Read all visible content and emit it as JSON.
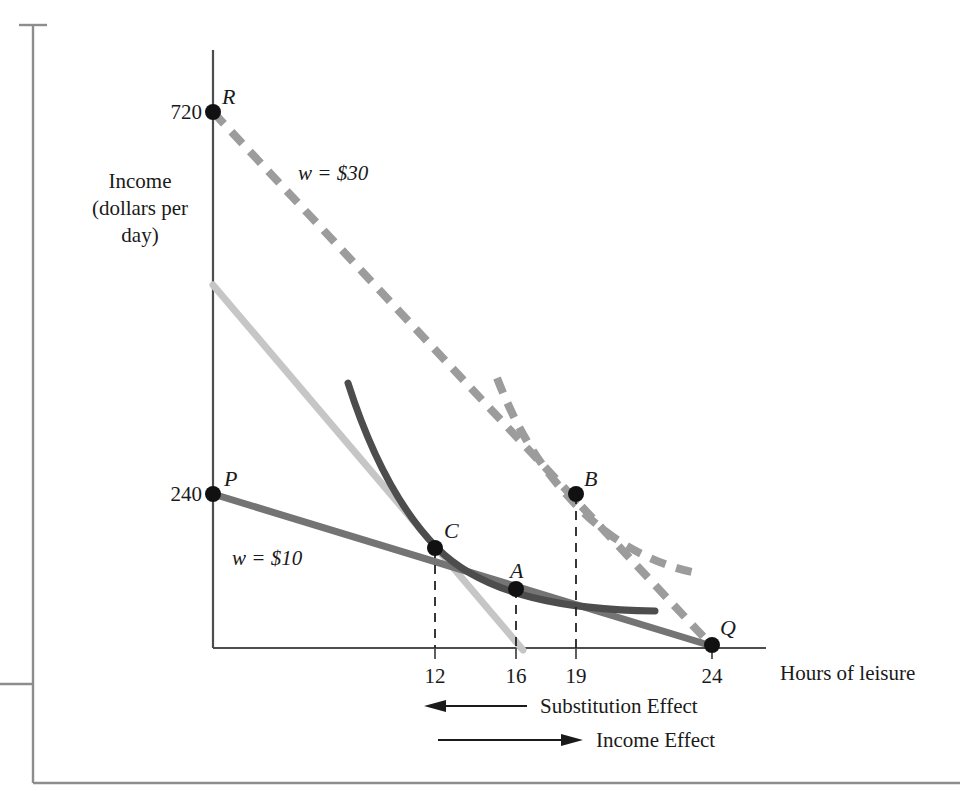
{
  "figure": {
    "axes": {
      "y_title_lines": [
        "Income",
        "(dollars per",
        "day)"
      ],
      "x_title": "Hours of leisure",
      "y_ticks": [
        {
          "value": 720,
          "label": "720"
        },
        {
          "value": 240,
          "label": "240"
        }
      ],
      "x_ticks": [
        {
          "value": 12,
          "label": "12"
        },
        {
          "value": 16,
          "label": "16"
        },
        {
          "value": 19,
          "label": "19"
        },
        {
          "value": 24,
          "label": "24"
        }
      ],
      "xlim": [
        0,
        26
      ],
      "ylim": [
        0,
        900
      ]
    },
    "points": [
      {
        "name": "R",
        "label": "R",
        "x": 0,
        "y": 720
      },
      {
        "name": "P",
        "label": "P",
        "x": 0,
        "y": 240
      },
      {
        "name": "C",
        "label": "C",
        "x": 12,
        "y": 170
      },
      {
        "name": "A",
        "label": "A",
        "x": 16,
        "y": 108
      },
      {
        "name": "B",
        "label": "B",
        "x": 19,
        "y": 250
      },
      {
        "name": "Q",
        "label": "Q",
        "x": 24,
        "y": 0
      }
    ],
    "budget_lines": [
      {
        "name": "high-wage-budget-line",
        "label": "w = $30",
        "style": "dashed",
        "color": "#9a9a9a",
        "from": {
          "x": 0,
          "y": 720
        },
        "to": {
          "x": 24,
          "y": 0
        }
      },
      {
        "name": "low-wage-budget-line",
        "label": "w = $10",
        "style": "solid",
        "color": "#6e6e6e",
        "from": {
          "x": 0,
          "y": 240
        },
        "to": {
          "x": 24,
          "y": 0
        }
      },
      {
        "name": "compensated-budget-line",
        "label": "",
        "style": "solid",
        "color": "#c3c3c3",
        "from": {
          "x": 0,
          "y": 540
        },
        "to": {
          "x": 17,
          "y": 0
        }
      }
    ],
    "indifference_curves": [
      {
        "name": "low-indifference-curve",
        "style": "solid",
        "color": "#4a4a4a",
        "through_points": [
          "C",
          "A"
        ]
      },
      {
        "name": "high-indifference-curve",
        "style": "dashed",
        "color": "#9a9a9a",
        "through_points": [
          "B"
        ]
      }
    ],
    "drop_lines": [
      {
        "name": "drop-line-12",
        "x": 12
      },
      {
        "name": "drop-line-16",
        "x": 16
      },
      {
        "name": "drop-line-19",
        "x": 19
      }
    ],
    "effect_arrows": [
      {
        "name": "substitution-effect",
        "label": "Substitution Effect",
        "direction": "left"
      },
      {
        "name": "income-effect",
        "label": "Income Effect",
        "direction": "right"
      }
    ],
    "wage_labels": [
      {
        "name": "wage-label-30",
        "text": "w = $30"
      },
      {
        "name": "wage-label-10",
        "text": "w = $10"
      }
    ],
    "colors": {
      "axis": "#4d4d4d",
      "point": "#111111",
      "text": "#1a1a1a",
      "page_border": "#8d8d8d"
    }
  }
}
